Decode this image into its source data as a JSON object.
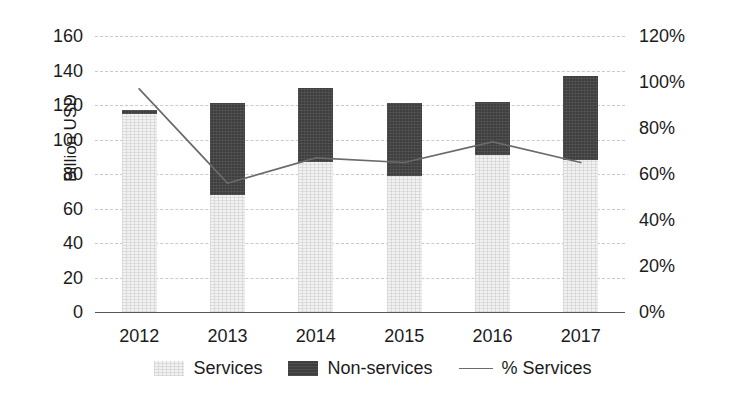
{
  "chart_data": {
    "type": "bar",
    "title": "",
    "subtitle": "",
    "xlabel": "",
    "ylabel": "Billion USD",
    "y2label": "",
    "categories": [
      "2012",
      "2013",
      "2014",
      "2015",
      "2016",
      "2017"
    ],
    "stacked": true,
    "grid": true,
    "legend_position": "bottom",
    "ylim": [
      0,
      160
    ],
    "y2lim": [
      0,
      120
    ],
    "yticks": [
      0,
      20,
      40,
      60,
      80,
      100,
      120,
      140,
      160
    ],
    "ytick_labels": [
      "0",
      "20",
      "40",
      "60",
      "80",
      "100",
      "120",
      "140",
      "160"
    ],
    "y2ticks": [
      0,
      20,
      40,
      60,
      80,
      100,
      120
    ],
    "y2tick_labels": [
      "0%",
      "20%",
      "40%",
      "60%",
      "80%",
      "100%",
      "120%"
    ],
    "series": [
      {
        "name": "Services",
        "kind": "bar",
        "axis": "left",
        "color": "#f2f2f2",
        "values": [
          115,
          68,
          87,
          79,
          91,
          88
        ]
      },
      {
        "name": "Non-services",
        "kind": "bar",
        "axis": "left",
        "color": "#3f3f3f",
        "values": [
          2,
          53,
          43,
          42,
          31,
          49
        ]
      },
      {
        "name": "% Services",
        "kind": "line",
        "axis": "right",
        "color": "#6a6a6a",
        "values": [
          97,
          56,
          67,
          65,
          74,
          65
        ]
      }
    ],
    "totals": [
      117,
      121,
      130,
      121,
      122,
      137
    ]
  },
  "legend": {
    "items": [
      {
        "label": "Services",
        "marker": "swatch-services"
      },
      {
        "label": "Non-services",
        "marker": "swatch-nonservices"
      },
      {
        "label": "% Services",
        "marker": "line-sample"
      }
    ]
  },
  "colors": {
    "services": "#f2f2f2",
    "non_services": "#3f3f3f",
    "line": "#6a6a6a",
    "grid": "#c9c9c9",
    "axis": "#555555",
    "text": "#1b1b1b",
    "background": "#ffffff"
  }
}
